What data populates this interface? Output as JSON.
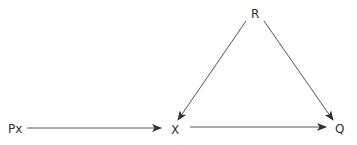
{
  "diagram": {
    "type": "directed-graph",
    "nodes": [
      {
        "id": "R",
        "label": "R",
        "x": 255,
        "y": 14
      },
      {
        "id": "Px",
        "label": "Px",
        "x": 16,
        "y": 129
      },
      {
        "id": "X",
        "label": "X",
        "x": 175,
        "y": 130
      },
      {
        "id": "Q",
        "label": "Q",
        "x": 340,
        "y": 129
      }
    ],
    "edges": [
      {
        "from": "Px",
        "to": "X"
      },
      {
        "from": "X",
        "to": "Q"
      },
      {
        "from": "R",
        "to": "X"
      },
      {
        "from": "R",
        "to": "Q"
      }
    ],
    "colors": {
      "line": "#444444",
      "text": "#333333",
      "background": "#ffffff"
    }
  }
}
